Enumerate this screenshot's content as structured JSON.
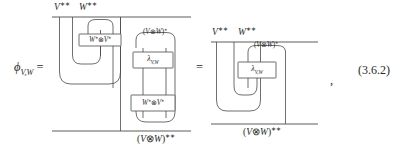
{
  "equation": {
    "number": "(3.6.2)",
    "lhs_symbol": "ϕ",
    "lhs_subscript": "V,W",
    "equals": "=",
    "comma": ","
  },
  "labels": {
    "V_double_dual": "V",
    "W_double_dual": "W",
    "double_star": "∗∗",
    "single_star": "∗",
    "tensor": "⊗",
    "V_star_text": "V",
    "W_star_text": "W"
  },
  "left_diagram": {
    "name": "left-string-diagram",
    "top_wires": [
      {
        "label_base": "V",
        "label_sup": "∗∗",
        "full": "V∗∗"
      },
      {
        "label_base": "W",
        "label_sup": "∗∗",
        "full": "W∗∗"
      }
    ],
    "boxes": [
      {
        "id": "box-wstar-vstar-upper",
        "text_base": "W",
        "text_sup": "∗",
        "tensor": "⊗",
        "text_base2": "V",
        "text_sup2": "∗",
        "full": "W∗⊗V∗"
      },
      {
        "id": "box-lambda",
        "text_base": "λ",
        "text_sub": "V,W",
        "full": "λV,W"
      },
      {
        "id": "box-wstar-vstar-lower",
        "text_base": "W",
        "text_sup": "∗",
        "tensor": "⊗",
        "text_base2": "V",
        "text_sup2": "∗",
        "full": "W∗⊗V∗"
      }
    ],
    "inner_wire_label": {
      "full": "(V⊗W)∗",
      "open": "(",
      "base1": "V",
      "tensor": "⊗",
      "base2": "W",
      "close": ")",
      "sup": "∗"
    },
    "bottom_wire_label": {
      "full": "(V⊗W)∗∗",
      "open": "(",
      "base1": "V",
      "tensor": "⊗",
      "base2": "W",
      "close": ")",
      "sup": "∗∗"
    }
  },
  "right_diagram": {
    "name": "right-string-diagram",
    "top_wires": [
      {
        "label_base": "V",
        "label_sup": "∗∗",
        "full": "V∗∗"
      },
      {
        "label_base": "W",
        "label_sup": "∗∗",
        "full": "W∗∗"
      }
    ],
    "boxes": [
      {
        "id": "box-lambda-right",
        "text_base": "λ",
        "text_sub": "V,W",
        "full": "λV,W"
      }
    ],
    "inner_wire_label": {
      "full": "(V⊗W)∗",
      "open": "(",
      "base1": "V",
      "tensor": "⊗",
      "base2": "W",
      "close": ")",
      "sup": "∗"
    },
    "bottom_wire_label": {
      "full": "(V⊗W)∗∗",
      "open": "(",
      "base1": "V",
      "tensor": "⊗",
      "base2": "W",
      "close": ")",
      "sup": "∗∗"
    }
  },
  "colors": {
    "ink": "#2a2a2a",
    "wire": "#4a4a4a",
    "background": "#ffffff"
  }
}
